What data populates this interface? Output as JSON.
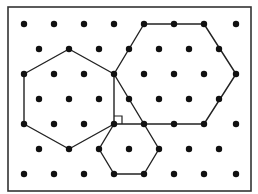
{
  "diagram": {
    "type": "triangular-dot-lattice-with-hexagons",
    "frame": {
      "x": 8,
      "y": 7,
      "width": 243,
      "height": 184,
      "stroke": "#333333"
    },
    "lattice": {
      "rows": [
        {
          "y": 24,
          "xs": [
            24,
            54,
            84,
            114,
            144,
            174,
            204,
            236
          ]
        },
        {
          "y": 49,
          "xs": [
            39,
            69,
            99,
            129,
            159,
            189,
            219
          ]
        },
        {
          "y": 74,
          "xs": [
            24,
            54,
            84,
            114,
            144,
            174,
            204,
            236
          ]
        },
        {
          "y": 99,
          "xs": [
            39,
            69,
            99,
            129,
            159,
            189,
            219
          ]
        },
        {
          "y": 124,
          "xs": [
            24,
            54,
            84,
            114,
            144,
            174,
            204,
            236
          ]
        },
        {
          "y": 149,
          "xs": [
            39,
            69,
            99,
            129,
            159,
            189,
            219
          ]
        },
        {
          "y": 174,
          "xs": [
            24,
            54,
            84,
            114,
            144,
            174,
            204,
            236
          ]
        }
      ],
      "dot_radius": 3.2,
      "dot_color": "#111111"
    },
    "hexagons": [
      {
        "name": "left-hexagon",
        "points": [
          [
            69,
            49
          ],
          [
            114,
            74
          ],
          [
            114,
            124
          ],
          [
            69,
            149
          ],
          [
            24,
            124
          ],
          [
            24,
            74
          ]
        ]
      },
      {
        "name": "large-right-hexagon",
        "points": [
          [
            144,
            24
          ],
          [
            204,
            24
          ],
          [
            236,
            74
          ],
          [
            204,
            124
          ],
          [
            144,
            124
          ],
          [
            114,
            74
          ]
        ]
      },
      {
        "name": "small-bottom-hexagon",
        "points": [
          [
            114,
            124
          ],
          [
            144,
            124
          ],
          [
            159,
            149
          ],
          [
            144,
            174
          ],
          [
            114,
            174
          ],
          [
            99,
            149
          ]
        ]
      }
    ],
    "line_color": "#222222",
    "right_angle_marker": {
      "x": 114,
      "y": 116,
      "size": 8
    }
  }
}
